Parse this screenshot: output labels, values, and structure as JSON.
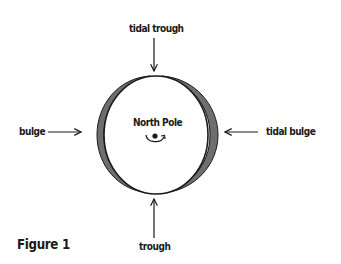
{
  "figure": {
    "caption": "Figure 1",
    "center_label": "North Pole",
    "labels": {
      "top": "tidal trough",
      "bottom": "trough",
      "left": "bulge",
      "right": "tidal bulge"
    },
    "colors": {
      "outline": "#1a1a1a",
      "bulge_fill": "#6e6e6e",
      "background": "#ffffff"
    },
    "icons": {
      "rotation": "counterclockwise-rotation-arrow-icon",
      "pole_dot": "pole-dot-icon"
    }
  }
}
